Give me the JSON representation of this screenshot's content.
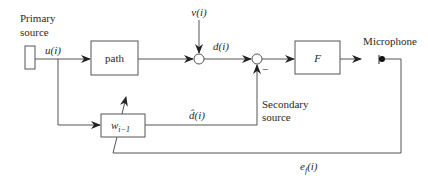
{
  "diagram": {
    "type": "block-diagram",
    "labels": {
      "primary_source_line1": "Primary",
      "primary_source_line2": "source",
      "input_signal": "u(i)",
      "path_block": "path",
      "disturbance": "v(i)",
      "desired_signal": "d(i)",
      "filter_block": "F",
      "microphone": "Microphone",
      "adaptive_block": "w",
      "adaptive_block_subscript": "i−1",
      "estimate_signal": "d̂(i)",
      "secondary_source_line1": "Secondary",
      "secondary_source_line2": "source",
      "error_signal": "e",
      "error_signal_subscript": "f",
      "error_signal_suffix": "(i)",
      "minus_sign": "−"
    },
    "colors": {
      "stroke": "#555555",
      "text": "#2a2a2a",
      "background": "#ffffff"
    }
  }
}
